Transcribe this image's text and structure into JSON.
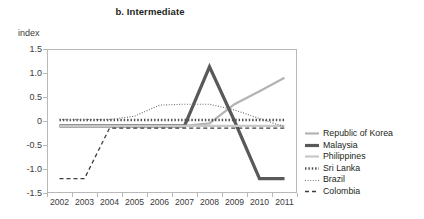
{
  "chart_data": {
    "type": "line",
    "title": "b. Intermediate",
    "ylabel": "index",
    "xlabel": "",
    "ylim": [
      -1.5,
      1.5
    ],
    "ytick_labels": [
      "1.5",
      "1.0",
      "0.5",
      "0",
      "-0.5",
      "-1.0",
      "-1.5"
    ],
    "ytick_values": [
      1.5,
      1.0,
      0.5,
      0,
      -0.5,
      -1.0,
      -1.5
    ],
    "categories": [
      "2002",
      "2003",
      "2004",
      "2005",
      "2006",
      "2007",
      "2008",
      "2009",
      "2010",
      "2011"
    ],
    "x": [
      2002,
      2003,
      2004,
      2005,
      2006,
      2007,
      2008,
      2009,
      2010,
      2011
    ],
    "grid": false,
    "legend_position": "right",
    "series": [
      {
        "name": "Republic of Korea",
        "style": "solid",
        "color": "#b3b3b3",
        "width": 2.2,
        "values": [
          -0.1,
          -0.1,
          -0.1,
          -0.1,
          -0.1,
          -0.1,
          -0.05,
          0.35,
          0.62,
          0.9
        ]
      },
      {
        "name": "Malaysia",
        "style": "solid",
        "color": "#595959",
        "width": 3.2,
        "values": [
          -0.1,
          -0.1,
          -0.1,
          -0.1,
          -0.1,
          -0.1,
          1.13,
          0.0,
          -1.2,
          -1.2
        ]
      },
      {
        "name": "Philippines",
        "style": "solid",
        "color": "#c8c8c8",
        "width": 2.2,
        "values": [
          -0.1,
          -0.1,
          -0.1,
          -0.1,
          -0.1,
          -0.1,
          -0.1,
          -0.1,
          -0.1,
          -0.1
        ]
      },
      {
        "name": "Sri Lanka",
        "style": "dotted-thick",
        "color": "#4d4d4d",
        "width": 2.6,
        "values": [
          0.02,
          0.02,
          0.02,
          0.02,
          0.02,
          0.02,
          0.02,
          0.02,
          0.02,
          0.02
        ]
      },
      {
        "name": "Brazil",
        "style": "dotted-fine",
        "color": "#6e6e6e",
        "width": 1.1,
        "values": [
          0.03,
          0.03,
          0.03,
          0.1,
          0.33,
          0.35,
          0.35,
          0.23,
          0.05,
          -0.12
        ]
      },
      {
        "name": "Colombia",
        "style": "dashed",
        "color": "#3d3d3d",
        "width": 1.3,
        "values": [
          -1.2,
          -1.2,
          -0.15,
          -0.15,
          -0.15,
          -0.15,
          -0.15,
          -0.15,
          -0.15,
          -0.15
        ]
      }
    ]
  }
}
